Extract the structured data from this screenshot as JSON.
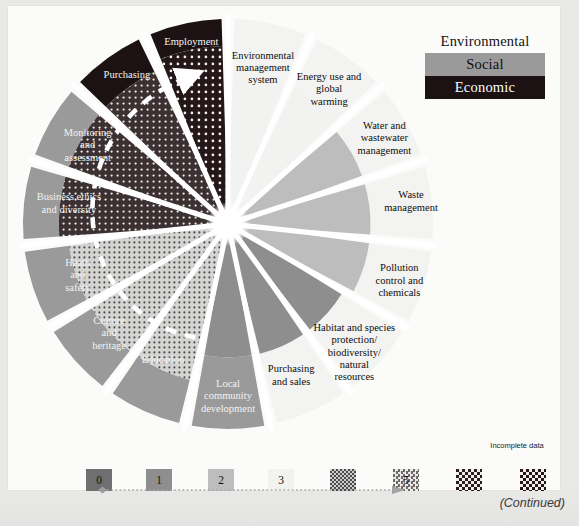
{
  "figure": {
    "type": "radial-wheel-diagram",
    "continued_note": "(Continued)"
  },
  "key": {
    "title": "Sustainability dimensions",
    "items": [
      {
        "label": "Environmental",
        "color": "#fbfbfa",
        "text_color": "#111111"
      },
      {
        "label": "Social",
        "color": "#9a9a9a",
        "text_color": "#101010"
      },
      {
        "label": "Economic",
        "color": "#1c1213",
        "text_color": "#fdfdfd"
      }
    ]
  },
  "scale": {
    "levels": [
      {
        "label": "0",
        "color": "#6f6f6f",
        "pattern": "solid"
      },
      {
        "label": "1",
        "color": "#8e8e8e",
        "pattern": "solid"
      },
      {
        "label": "2",
        "color": "#bdbdbd",
        "pattern": "solid"
      },
      {
        "label": "3",
        "color": "#f2f2f0",
        "pattern": "solid"
      },
      {
        "label": "4",
        "color": "#cfcfcf",
        "pattern": "dots-fine"
      },
      {
        "label": "5",
        "color": "#6a6a6a",
        "pattern": "dots-mid"
      },
      {
        "label": "6",
        "color": "#2a1f20",
        "pattern": "dots-coarse"
      }
    ],
    "incomplete": {
      "label": "Incomplete\ndata",
      "color": "#241719",
      "pattern": "dots-coarse"
    },
    "progression_arrow": true
  },
  "sectors": [
    {
      "id": "environmental-management-system",
      "label": "Environmental\nmanagement\nsystem",
      "dimension": "Environmental",
      "level": 3
    },
    {
      "id": "energy-use-and-global-warming",
      "label": "Energy use and\nglobal\nwarming",
      "dimension": "Environmental",
      "level": 3
    },
    {
      "id": "water-and-wastewater-management",
      "label": "Water and\nwastewater\nmanagement",
      "dimension": "Environmental",
      "level": 2
    },
    {
      "id": "waste-management",
      "label": "Waste\nmanagement",
      "dimension": "Environmental",
      "level": 2
    },
    {
      "id": "pollution-control-and-chemicals",
      "label": "Pollution\ncontrol and\nchemicals",
      "dimension": "Environmental",
      "level": 2
    },
    {
      "id": "habitat-and-species-protection",
      "label": "Habitat and species\nprotection/\nbiodiversity/\nnatural\nresources",
      "dimension": "Environmental",
      "level": 1
    },
    {
      "id": "purchasing-and-sales",
      "label": "Purchasing\nand sales",
      "dimension": "Environmental",
      "level": 1
    },
    {
      "id": "local-community-development",
      "label": "Local\ncommunity\ndevelopment",
      "dimension": "Social",
      "level": 1
    },
    {
      "id": "education",
      "label": "Education",
      "dimension": "Social",
      "level": 4
    },
    {
      "id": "culture-and-heritage",
      "label": "Culture\nand\nheritage",
      "dimension": "Social",
      "level": 4
    },
    {
      "id": "heath-and-safety",
      "label": "Heath\nand\nsafety",
      "dimension": "Social",
      "level": 4
    },
    {
      "id": "business-ethics-and-diversity",
      "label": "Business ethics\nand diversity",
      "dimension": "Social",
      "level": 5
    },
    {
      "id": "monitoring-and-assessment",
      "label": "Monitoring\nand\nassessment",
      "dimension": "Social",
      "level": 5
    },
    {
      "id": "purchasing",
      "label": "Purchasing",
      "dimension": "Economic",
      "level": 5
    },
    {
      "id": "employment",
      "label": "Employment",
      "dimension": "Economic",
      "level": 6
    }
  ],
  "chart_data": {
    "type": "pie",
    "categories": [
      "Environmental management system",
      "Energy use and global warming",
      "Water and wastewater management",
      "Waste management",
      "Pollution control and chemicals",
      "Habitat and species protection/biodiversity/natural resources",
      "Purchasing and sales",
      "Local community development",
      "Education",
      "Culture and heritage",
      "Heath and safety",
      "Business ethics and diversity",
      "Monitoring and assessment",
      "Purchasing",
      "Employment"
    ],
    "values": [
      3,
      3,
      2,
      2,
      2,
      1,
      1,
      1,
      4,
      4,
      4,
      5,
      5,
      5,
      6
    ],
    "groups": [
      "Environmental",
      "Environmental",
      "Environmental",
      "Environmental",
      "Environmental",
      "Environmental",
      "Environmental",
      "Social",
      "Social",
      "Social",
      "Social",
      "Social",
      "Social",
      "Economic",
      "Economic"
    ],
    "ylabel": "Maturity level",
    "ylim": [
      0,
      6
    ],
    "legend_position": "top-right",
    "grid": false
  }
}
